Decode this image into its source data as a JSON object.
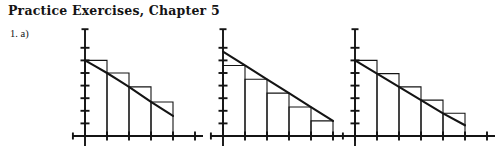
{
  "document": {
    "title": "Practice Exercises, Chapter 5",
    "problem_label": "1. a)"
  },
  "ink_color": "#141414",
  "background_color": "#ffffff",
  "chart_data": [
    {
      "id": "figure-left",
      "type": "bar",
      "title": "",
      "subtitle": "Circumscribed (left-endpoint) rectangles, n = 4",
      "xlabel": "",
      "ylabel": "",
      "grid": false,
      "legend": false,
      "axis_style": "number-line-with-ticks",
      "xlim": [
        0,
        5
      ],
      "ylim": [
        0,
        8
      ],
      "x_ticks": [
        1,
        2,
        3,
        4,
        5
      ],
      "y_ticks": [
        1,
        2,
        3,
        4,
        5,
        6,
        7
      ],
      "y_axis_top": 8,
      "x_axis_left_stub": -0.55,
      "bar_rule": "left-endpoint",
      "categories": [
        "1",
        "2",
        "3",
        "4"
      ],
      "bar_left_edges": [
        0,
        1,
        2,
        3
      ],
      "bar_width": 1,
      "values": [
        6.0,
        5.0,
        3.9,
        2.7
      ],
      "curve": {
        "name": "f(x)",
        "x": [
          0.0,
          0.5,
          1.0,
          1.5,
          2.0,
          2.5,
          3.0,
          3.5,
          4.0
        ],
        "y": [
          6.0,
          5.5,
          5.0,
          4.45,
          3.9,
          3.3,
          2.7,
          2.15,
          1.6
        ]
      }
    },
    {
      "id": "figure-middle",
      "type": "bar",
      "title": "",
      "subtitle": "Inscribed (right-endpoint) rectangles, n = 5",
      "xlabel": "",
      "ylabel": "",
      "grid": false,
      "legend": false,
      "axis_style": "number-line-with-ticks",
      "xlim": [
        0,
        6
      ],
      "ylim": [
        0,
        8
      ],
      "x_ticks": [
        1,
        2,
        3,
        4,
        5,
        6
      ],
      "y_ticks": [
        1,
        2,
        3,
        4,
        5,
        6,
        7
      ],
      "y_axis_top": 8,
      "x_axis_left_stub": -0.55,
      "bar_rule": "right-endpoint",
      "categories": [
        "1",
        "2",
        "3",
        "4",
        "5"
      ],
      "bar_left_edges": [
        0,
        1,
        2,
        3,
        4
      ],
      "bar_width": 1,
      "values": [
        5.6,
        4.5,
        3.4,
        2.3,
        1.2
      ],
      "curve": {
        "name": "f(x)",
        "x": [
          0.0,
          1.0,
          2.0,
          3.0,
          4.0,
          5.0
        ],
        "y": [
          6.7,
          5.6,
          4.5,
          3.4,
          2.3,
          1.2
        ]
      }
    },
    {
      "id": "figure-right",
      "type": "bar",
      "title": "",
      "subtitle": "Circumscribed (left-endpoint) rectangles, n = 5",
      "xlabel": "",
      "ylabel": "",
      "grid": false,
      "legend": false,
      "axis_style": "number-line-with-ticks",
      "xlim": [
        0,
        6
      ],
      "ylim": [
        0,
        8
      ],
      "x_ticks": [
        1,
        2,
        3,
        4,
        5,
        6
      ],
      "y_ticks": [
        1,
        2,
        3,
        4,
        5,
        6,
        7
      ],
      "y_axis_top": 8,
      "x_axis_left_stub": -0.55,
      "bar_rule": "left-endpoint",
      "categories": [
        "1",
        "2",
        "3",
        "4",
        "5"
      ],
      "bar_left_edges": [
        0,
        1,
        2,
        3,
        4
      ],
      "bar_width": 1,
      "values": [
        6.0,
        4.95,
        3.9,
        2.85,
        1.8
      ],
      "curve": {
        "name": "f(x)",
        "x": [
          0.0,
          1.0,
          2.0,
          3.0,
          4.0,
          5.0
        ],
        "y": [
          6.0,
          4.95,
          3.9,
          2.85,
          1.8,
          0.85
        ]
      }
    }
  ]
}
